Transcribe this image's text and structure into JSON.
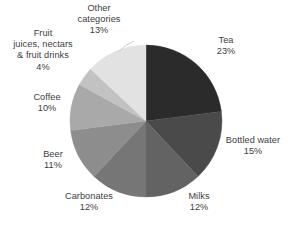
{
  "chart_data": {
    "type": "pie",
    "title": "",
    "xlabel": "",
    "ylabel": "",
    "legend_position": "none",
    "grid": false,
    "units": "percent",
    "total": 100,
    "start_angle_deg": 0,
    "direction": "clockwise",
    "categories": [
      "Tea",
      "Bottled water",
      "Milks",
      "Carbonates",
      "Beer",
      "Coffee",
      "Fruit juices, nectars & fruit drinks",
      "Other categories"
    ],
    "values": [
      23,
      15,
      12,
      12,
      11,
      10,
      4,
      13
    ],
    "slices": [
      {
        "name": "Tea",
        "value": 23,
        "value_label": "23%",
        "color": "#2b2b2b",
        "label_lines": [
          "Tea",
          "23%"
        ]
      },
      {
        "name": "Bottled water",
        "value": 15,
        "value_label": "15%",
        "color": "#4a4a4a",
        "label_lines": [
          "Bottled water",
          "15%"
        ]
      },
      {
        "name": "Milks",
        "value": 12,
        "value_label": "12%",
        "color": "#636363",
        "label_lines": [
          "Milks",
          "12%"
        ]
      },
      {
        "name": "Carbonates",
        "value": 12,
        "value_label": "12%",
        "color": "#767676",
        "label_lines": [
          "Carbonates",
          "12%"
        ]
      },
      {
        "name": "Beer",
        "value": 11,
        "value_label": "11%",
        "color": "#8d8d8d",
        "label_lines": [
          "Beer",
          "11%"
        ]
      },
      {
        "name": "Coffee",
        "value": 10,
        "value_label": "10%",
        "color": "#a9a9a9",
        "label_lines": [
          "Coffee",
          "10%"
        ]
      },
      {
        "name": "Fruit juices, nectars & fruit drinks",
        "value": 4,
        "value_label": "4%",
        "color": "#c2c2c2",
        "label_lines": [
          "Fruit",
          "juices, nectars",
          "& fruit drinks",
          "4%"
        ]
      },
      {
        "name": "Other categories",
        "value": 13,
        "value_label": "13%",
        "color": "#e2e2e2",
        "label_lines": [
          "Other",
          "categories",
          "13%"
        ]
      }
    ]
  },
  "labels": {
    "tea": {
      "name": "Tea",
      "pct": "23%"
    },
    "bottled_water": {
      "name": "Bottled water",
      "pct": "15%"
    },
    "milks": {
      "name": "Milks",
      "pct": "12%"
    },
    "carbonates": {
      "name": "Carbonates",
      "pct": "12%"
    },
    "beer": {
      "name": "Beer",
      "pct": "11%"
    },
    "coffee": {
      "name": "Coffee",
      "pct": "10%"
    },
    "fruit": {
      "line1": "Fruit",
      "line2": "juices, nectars",
      "line3": "& fruit drinks",
      "pct": "4%"
    },
    "other": {
      "line1": "Other",
      "line2": "categories",
      "pct": "13%"
    }
  },
  "colors": {
    "background": "#ffffff",
    "text": "#3d3d3d",
    "slice_tea": "#2b2b2b",
    "slice_bottled_water": "#4a4a4a",
    "slice_milks": "#636363",
    "slice_carbonates": "#767676",
    "slice_beer": "#8d8d8d",
    "slice_coffee": "#a9a9a9",
    "slice_fruit": "#c2c2c2",
    "slice_other": "#e2e2e2"
  }
}
